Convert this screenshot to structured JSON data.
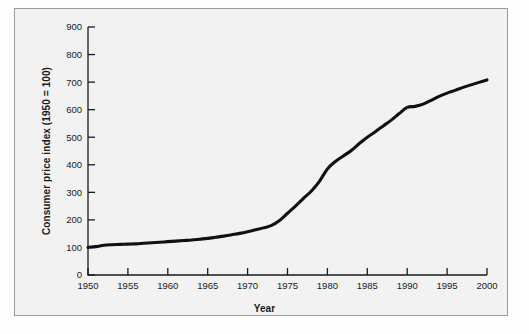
{
  "chart_data": {
    "type": "line",
    "title": "",
    "xlabel": "Year",
    "ylabel": "Consumer price index (1950 = 100)",
    "xlim": [
      1950,
      2000
    ],
    "ylim": [
      0,
      900
    ],
    "xticks": [
      1950,
      1955,
      1960,
      1965,
      1970,
      1975,
      1980,
      1985,
      1990,
      1995,
      2000
    ],
    "yticks": [
      0,
      100,
      200,
      300,
      400,
      500,
      600,
      700,
      800,
      900
    ],
    "grid": false,
    "legend": null,
    "series": [
      {
        "name": "Consumer price index (1950 = 100)",
        "color": "#111111",
        "x": [
          1950,
          1951,
          1952,
          1953,
          1954,
          1955,
          1956,
          1957,
          1958,
          1959,
          1960,
          1961,
          1962,
          1963,
          1964,
          1965,
          1966,
          1967,
          1968,
          1969,
          1970,
          1971,
          1972,
          1973,
          1974,
          1975,
          1976,
          1977,
          1978,
          1979,
          1980,
          1981,
          1982,
          1983,
          1984,
          1985,
          1986,
          1987,
          1988,
          1989,
          1990,
          1991,
          1992,
          1993,
          1994,
          1995,
          1996,
          1997,
          1998,
          1999,
          2000
        ],
        "values": [
          100,
          103,
          108,
          110,
          111,
          112,
          113,
          115,
          117,
          119,
          121,
          123,
          125,
          127,
          130,
          133,
          137,
          141,
          146,
          151,
          157,
          164,
          171,
          180,
          198,
          224,
          250,
          278,
          305,
          340,
          385,
          412,
          432,
          452,
          477,
          500,
          520,
          541,
          562,
          586,
          608,
          612,
          620,
          634,
          648,
          660,
          670,
          681,
          690,
          699,
          708
        ]
      }
    ]
  },
  "axis": {
    "xlabel": "Year",
    "ylabel": "Consumer price index (1950 = 100)"
  }
}
